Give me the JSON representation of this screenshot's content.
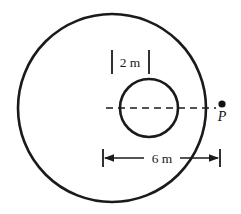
{
  "figure": {
    "type": "geometry-diagram",
    "background_color": "#ffffff",
    "stroke_color": "#1a1a1a",
    "labels": {
      "inner_diameter": "2 m",
      "span_dimension": "6 m",
      "point": "P"
    },
    "geometry": {
      "outer_circle": {
        "cx": 112,
        "cy": 108,
        "r": 94,
        "stroke_width": 2.6
      },
      "inner_circle": {
        "cx": 149,
        "cy": 108,
        "r": 29,
        "stroke_width": 2.6
      },
      "center_line": {
        "y": 108,
        "x_start": 106,
        "x_end": 216,
        "dash": "7 5",
        "stroke_width": 1.7
      },
      "point_p": {
        "cx": 222,
        "cy": 104,
        "r": 3.6
      },
      "inner_tick_left_x": 112,
      "inner_tick_right_x": 149,
      "tick_y_top": 50,
      "tick_y_bottom": 74,
      "dim_line_y": 158,
      "dim_x_start": 103,
      "dim_x_end": 220,
      "dim_tick_half_height": 9,
      "label_2m_x": 130,
      "label_2m_y": 67,
      "label_6m_x": 161,
      "label_6m_y": 163,
      "label_p_x": 222,
      "label_p_y": 121
    }
  }
}
